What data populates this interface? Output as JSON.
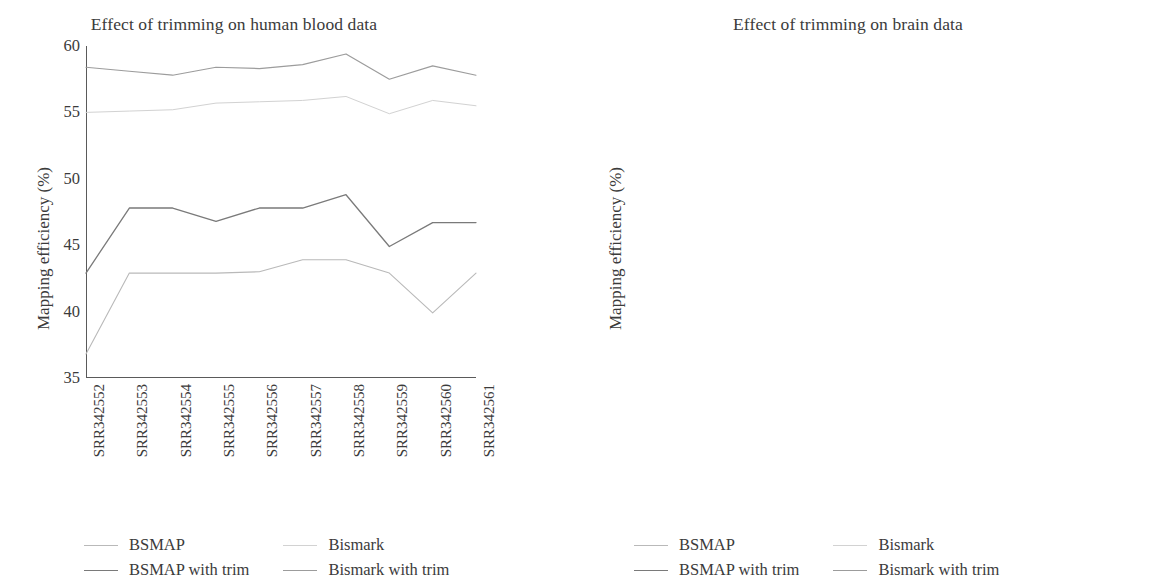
{
  "figure": {
    "ylabel": "Mapping efficiency (%)",
    "series_names": [
      "BSMAP",
      "Bismark",
      "BSMAP with trim",
      "Bismark with trim"
    ],
    "series_colors": [
      "#b9b9b9",
      "#d2d2d2",
      "#7a7a7a",
      "#9c9c9c"
    ],
    "series_widths": [
      1.1,
      1.0,
      1.3,
      1.2
    ]
  },
  "chart_data": [
    {
      "id": "human-blood",
      "type": "line",
      "title": "Effect of trimming on human blood data",
      "xlabel": "",
      "ylabel": "Mapping efficiency (%)",
      "ylim": [
        35,
        60
      ],
      "yticks": [
        35,
        40,
        45,
        50,
        55,
        60
      ],
      "grid": false,
      "legend_position": "bottom",
      "categories": [
        "SRR342552",
        "SRR342553",
        "SRR342554",
        "SRR342555",
        "SRR342556",
        "SRR342557",
        "SRR342558",
        "SRR342559",
        "SRR342560",
        "SRR342561"
      ],
      "series": [
        {
          "name": "BSMAP",
          "color": "#b9b9b9",
          "values": [
            36.8,
            42.9,
            42.9,
            42.9,
            43.0,
            43.9,
            43.9,
            42.9,
            39.9,
            42.9,
            42.8
          ]
        },
        {
          "name": "Bismark",
          "color": "#d2d2d2",
          "values": [
            55.0,
            55.1,
            55.2,
            55.7,
            55.8,
            55.9,
            56.2,
            54.9,
            55.9,
            55.5
          ]
        },
        {
          "name": "BSMAP with trim",
          "color": "#7a7a7a",
          "values": [
            42.9,
            47.8,
            47.8,
            46.8,
            47.8,
            47.8,
            48.8,
            44.9,
            46.7,
            46.7
          ]
        },
        {
          "name": "Bismark with trim",
          "color": "#9c9c9c",
          "values": [
            58.4,
            58.1,
            57.8,
            58.4,
            58.3,
            58.6,
            59.4,
            57.5,
            58.5,
            57.8
          ]
        }
      ]
    },
    {
      "id": "brain",
      "type": "line",
      "title": "Effect of trimming on brain data",
      "xlabel": "",
      "ylabel": "Mapping efficiency (%)",
      "ylim": [
        40,
        80
      ],
      "yticks": [
        40,
        45,
        50,
        55,
        60,
        65,
        70,
        75,
        80
      ],
      "grid": false,
      "legend_position": "bottom",
      "categories": [
        "SRR921759",
        "SRR921760",
        "SRR921761",
        "SRR921762",
        "SRR921763",
        "SRR921764",
        "SRR921765",
        "SRR921766",
        "SRR901380",
        "SRR901381",
        "SRR901382",
        "SRR901383",
        "SRR901384",
        "SRR901385",
        "SRR901386",
        "SRR901387",
        "SRR901388"
      ],
      "series": [
        {
          "name": "BSMAP",
          "color": "#b9b9b9",
          "values": [
            44.8,
            44.8,
            45.9,
            45.9,
            52.8,
            46.6,
            45.9,
            45.8,
            57.7,
            57.8,
            58.7,
            58.7,
            58.7,
            58.7,
            50.4,
            53.5,
            53.5
          ]
        },
        {
          "name": "Bismark",
          "color": "#d2d2d2",
          "values": [
            60.0,
            60.1,
            60.2,
            60.4,
            60.2,
            60.2,
            60.4,
            60.4,
            72.0,
            73.5,
            73.8,
            73.8,
            73.8,
            73.7,
            71.7,
            71.6,
            71.5
          ]
        },
        {
          "name": "BSMAP with trim",
          "color": "#7a7a7a",
          "values": [
            61.8,
            61.8,
            61.8,
            61.8,
            60.7,
            60.7,
            61.6,
            61.7,
            67.8,
            66.8,
            66.8,
            66.8,
            66.8,
            66.7,
            64.4,
            67.6,
            66.6
          ]
        },
        {
          "name": "Bismark with trim",
          "color": "#9c9c9c",
          "values": [
            66.1,
            66.2,
            66.2,
            66.2,
            64.9,
            65.1,
            65.2,
            65.3,
            77.7,
            77.7,
            77.5,
            77.5,
            77.4,
            77.6,
            77.6,
            77.6,
            77.6
          ]
        }
      ]
    }
  ],
  "panels": [
    {
      "title": "Effect of trimming on human blood data",
      "legend": [
        {
          "label": "BSMAP",
          "color": "#b9b9b9",
          "width": 1.1
        },
        {
          "label": "Bismark",
          "color": "#d2d2d2",
          "width": 1.0
        },
        {
          "label": "BSMAP with trim",
          "color": "#7a7a7a",
          "width": 1.4
        },
        {
          "label": "Bismark with trim",
          "color": "#9c9c9c",
          "width": 1.2
        }
      ]
    },
    {
      "title": "Effect of trimming on brain data",
      "legend": [
        {
          "label": "BSMAP",
          "color": "#b9b9b9",
          "width": 1.1
        },
        {
          "label": "Bismark",
          "color": "#d2d2d2",
          "width": 1.0
        },
        {
          "label": "BSMAP with trim",
          "color": "#7a7a7a",
          "width": 1.4
        },
        {
          "label": "Bismark with trim",
          "color": "#9c9c9c",
          "width": 1.2
        }
      ]
    }
  ]
}
